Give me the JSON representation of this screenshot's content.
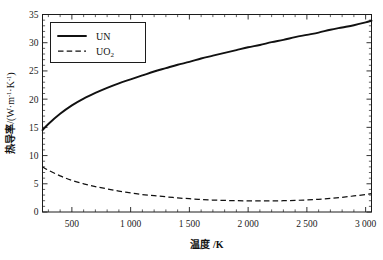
{
  "chart_data": {
    "type": "line",
    "title": "",
    "xlabel": "温度 /K",
    "ylabel": "热导率 /(W·m-1·K-1)",
    "ylabel_main": "热导率",
    "ylabel_unit": "/(W·m",
    "ylabel_unit_tail": "·K",
    "ylabel_unit_close": ")",
    "exponent": "-1",
    "xlim": [
      250,
      3050
    ],
    "ylim": [
      0,
      35
    ],
    "grid": false,
    "legend_position": "upper-left-inside",
    "x_tick_labels": [
      "500",
      "1 000",
      "1 500",
      "2 000",
      "2 500",
      "3 000"
    ],
    "x_tick_values": [
      500,
      1000,
      1500,
      2000,
      2500,
      3000
    ],
    "x_minor_step": 100,
    "y_tick_labels": [
      "0",
      "5",
      "10",
      "15",
      "20",
      "25",
      "30",
      "35"
    ],
    "y_tick_values": [
      0,
      5,
      10,
      15,
      20,
      25,
      30,
      35
    ],
    "y_minor_step": 1,
    "series": [
      {
        "name": "UN",
        "style": "solid",
        "color": "#111111",
        "x": [
          250,
          300,
          400,
          500,
          600,
          700,
          800,
          900,
          1000,
          1100,
          1200,
          1300,
          1400,
          1500,
          1600,
          1700,
          1800,
          1900,
          2000,
          2100,
          2200,
          2300,
          2400,
          2500,
          2600,
          2700,
          2800,
          2900,
          3000,
          3050
        ],
        "values": [
          14.5,
          15.6,
          17.4,
          18.9,
          20.1,
          21.1,
          22.0,
          22.8,
          23.5,
          24.2,
          24.9,
          25.5,
          26.1,
          26.6,
          27.2,
          27.7,
          28.2,
          28.7,
          29.2,
          29.6,
          30.1,
          30.5,
          31.0,
          31.4,
          31.8,
          32.3,
          32.7,
          33.1,
          33.6,
          33.9
        ]
      },
      {
        "name": "UO2",
        "style": "dashed",
        "color": "#111111",
        "x": [
          250,
          300,
          400,
          500,
          600,
          700,
          800,
          900,
          1000,
          1100,
          1200,
          1300,
          1400,
          1500,
          1600,
          1700,
          1800,
          1900,
          2000,
          2100,
          2200,
          2300,
          2400,
          2500,
          2600,
          2700,
          2800,
          2900,
          3000,
          3050
        ],
        "values": [
          8.0,
          7.4,
          6.4,
          5.6,
          5.0,
          4.5,
          4.1,
          3.7,
          3.4,
          3.1,
          2.9,
          2.7,
          2.5,
          2.35,
          2.22,
          2.12,
          2.05,
          2.0,
          1.97,
          1.96,
          1.97,
          2.0,
          2.06,
          2.14,
          2.25,
          2.4,
          2.6,
          2.85,
          3.1,
          3.25
        ]
      }
    ]
  },
  "legend": {
    "entries": [
      {
        "label": "UN",
        "sub": "",
        "style": "solid"
      },
      {
        "label": "UO",
        "sub": "2",
        "style": "dashed"
      }
    ]
  }
}
